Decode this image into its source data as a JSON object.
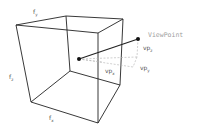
{
  "diagram": {
    "labels": {
      "face_y": "f",
      "face_y_sub": "y",
      "face_z": "f",
      "face_z_sub": "z",
      "face_x": "f",
      "face_x_sub": "x",
      "viewpoint": "ViewPoint",
      "vp_z": "vp",
      "vp_z_sub": "z",
      "vp_y": "vp",
      "vp_y_sub": "y",
      "vp_x": "vp",
      "vp_x_sub": "x"
    },
    "colors": {
      "edge": "#222222",
      "dashed": "#b0b0b0",
      "viewpoint_text": "#a0a0a0",
      "label_text": "#555555"
    }
  }
}
